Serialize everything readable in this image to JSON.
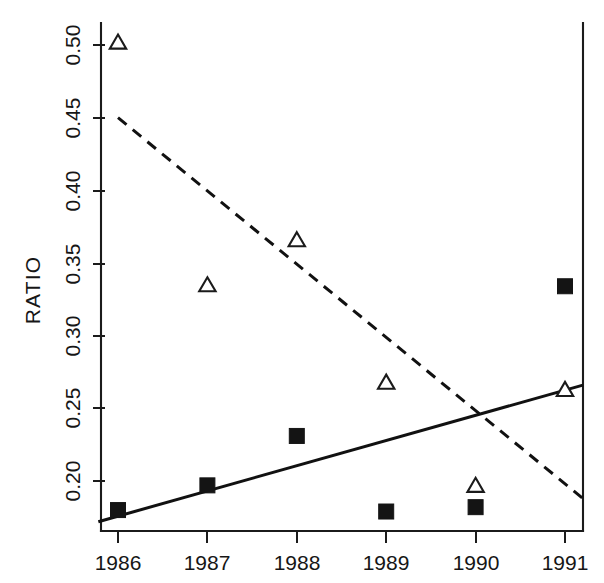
{
  "chart_data": {
    "type": "scatter",
    "title": "",
    "xlabel": "",
    "ylabel": "RATIO",
    "x": [
      1986,
      1987,
      1988,
      1989,
      1990,
      1991
    ],
    "categories": [
      "1986",
      "1987",
      "1988",
      "1989",
      "1990",
      "1991"
    ],
    "xtick_labels": [
      "1986",
      "1987",
      "1988",
      "1989",
      "1990",
      "1991"
    ],
    "ytick_labels": [
      "0.20",
      "0.25",
      "0.30",
      "0.35",
      "0.40",
      "0.45",
      "0.50"
    ],
    "ytick_values": [
      0.2,
      0.25,
      0.3,
      0.35,
      0.4,
      0.45,
      0.5
    ],
    "xlim": [
      1985.78,
      1991.2
    ],
    "ylim": [
      0.172,
      0.521
    ],
    "grid": false,
    "legend": "none",
    "series": [
      {
        "name": "open-triangle-series",
        "marker": "open-triangle",
        "color": "#1b1b1b",
        "values": [
          0.502,
          0.335,
          0.366,
          0.268,
          0.197,
          0.263
        ]
      },
      {
        "name": "filled-square-series",
        "marker": "filled-square",
        "color": "#141414",
        "values": [
          0.18,
          0.197,
          0.231,
          0.179,
          0.182,
          0.334
        ]
      }
    ],
    "trend_lines": [
      {
        "name": "dashed-declining-trend",
        "style": "dashed",
        "color": "#111111",
        "x_start": 1986.0,
        "y_start": 0.45,
        "x_end": 1991.2,
        "y_end": 0.188
      },
      {
        "name": "solid-rising-trend",
        "style": "solid",
        "color": "#111111",
        "x_start": 1985.78,
        "y_start": 0.172,
        "x_end": 1991.2,
        "y_end": 0.266
      }
    ]
  },
  "axes": {
    "y_axis_title": "RATIO"
  }
}
